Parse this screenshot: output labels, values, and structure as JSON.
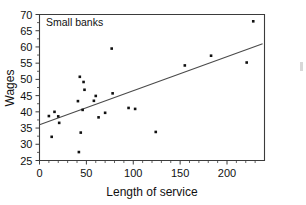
{
  "figure": {
    "background_color": "#ffffff",
    "foreground_color": "#111111",
    "annotation": "Small banks"
  },
  "chart_data": {
    "type": "scatter",
    "title": "",
    "annotation": "Small banks",
    "xlabel": "Length of service",
    "ylabel": "Wages",
    "xlim": [
      0,
      240
    ],
    "ylim": [
      25,
      70
    ],
    "xticks": [
      0,
      50,
      100,
      150,
      200
    ],
    "xtick_labels": [
      "0",
      "50",
      "100",
      "150",
      "200"
    ],
    "yticks": [
      25,
      30,
      35,
      40,
      45,
      50,
      55,
      60,
      65,
      70
    ],
    "ytick_labels": [
      "25",
      "30",
      "35",
      "40",
      "45",
      "50",
      "55",
      "60",
      "65",
      "70"
    ],
    "grid": false,
    "legend": false,
    "marker": "square",
    "marker_color": "#111111",
    "points": [
      {
        "x": 10,
        "y": 38.7
      },
      {
        "x": 13,
        "y": 32.3
      },
      {
        "x": 16,
        "y": 40.0
      },
      {
        "x": 20,
        "y": 38.6
      },
      {
        "x": 21,
        "y": 36.6
      },
      {
        "x": 41,
        "y": 43.3
      },
      {
        "x": 42,
        "y": 27.6
      },
      {
        "x": 43,
        "y": 50.8
      },
      {
        "x": 44,
        "y": 33.6
      },
      {
        "x": 46,
        "y": 40.6
      },
      {
        "x": 47,
        "y": 49.2
      },
      {
        "x": 48,
        "y": 46.8
      },
      {
        "x": 58,
        "y": 43.4
      },
      {
        "x": 60,
        "y": 44.9
      },
      {
        "x": 63,
        "y": 38.3
      },
      {
        "x": 70,
        "y": 39.7
      },
      {
        "x": 77,
        "y": 59.5
      },
      {
        "x": 78,
        "y": 45.7
      },
      {
        "x": 95,
        "y": 41.2
      },
      {
        "x": 102,
        "y": 40.9
      },
      {
        "x": 124,
        "y": 33.8
      },
      {
        "x": 155,
        "y": 54.3
      },
      {
        "x": 183,
        "y": 57.3
      },
      {
        "x": 221,
        "y": 55.2
      },
      {
        "x": 228,
        "y": 67.9
      }
    ],
    "fit_line": {
      "type": "linear-regression",
      "x_start": 0,
      "y_start": 36.0,
      "x_end": 238,
      "y_end": 61.0
    }
  }
}
